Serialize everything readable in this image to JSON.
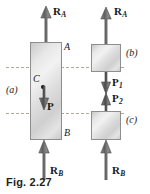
{
  "figure": {
    "caption": "Fig. 2.27",
    "panels": [
      {
        "id": "a",
        "label": "(a)"
      },
      {
        "id": "b",
        "label": "(b)"
      },
      {
        "id": "c",
        "label": "(c)"
      }
    ]
  },
  "panel_a": {
    "name": "whole-bar-free-body",
    "section_top_label": "A",
    "section_bottom_label": "B",
    "centroid_label": "C",
    "reaction_top": {
      "symbol": "R",
      "subscript": "A",
      "direction": "up"
    },
    "reaction_bottom": {
      "symbol": "R",
      "subscript": "B",
      "direction": "up"
    },
    "load": {
      "symbol": "P",
      "subscript": "",
      "direction": "down"
    }
  },
  "panel_b": {
    "name": "upper-segment-free-body",
    "reaction_top": {
      "symbol": "R",
      "subscript": "A",
      "direction": "up"
    },
    "internal_force": {
      "symbol": "P",
      "subscript": "1",
      "direction": "down"
    }
  },
  "panel_c": {
    "name": "lower-segment-free-body",
    "internal_force": {
      "symbol": "P",
      "subscript": "2",
      "direction": "up"
    },
    "reaction_bottom": {
      "symbol": "R",
      "subscript": "B",
      "direction": "up"
    }
  },
  "colors": {
    "body_fill_light": "#f2f2f2",
    "body_fill_dark": "#c9c9c9",
    "body_stroke": "#8e8e8e",
    "arrow": "#6e6e6e",
    "arrow_stroke": "#555555",
    "dash_line": "#b0a99a",
    "text": "#1a1a1a",
    "caption": "#231f20",
    "background": "#ffffff"
  }
}
